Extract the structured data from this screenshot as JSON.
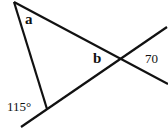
{
  "diagram": {
    "labels": {
      "angle_a": "a",
      "angle_b": "b",
      "angle_70": "70",
      "angle_115": "115°"
    },
    "line_color": "#111111"
  }
}
